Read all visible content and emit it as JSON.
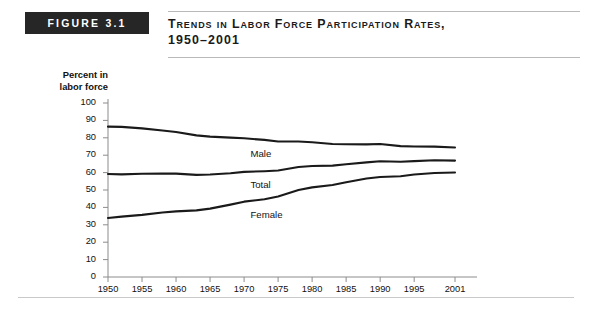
{
  "figure": {
    "badge": "FIGURE 3.1",
    "title_line1": "Trends in Labor Force Participation Rates,",
    "title_line2": "1950–2001"
  },
  "chart_data": {
    "type": "line",
    "xlabel": "",
    "ylabel": "Percent in labor force",
    "ylabel_line1": "Percent in",
    "ylabel_line2": "labor force",
    "ylim": [
      0,
      100
    ],
    "xlim": [
      1950,
      2001
    ],
    "grid": false,
    "legend": "inline-labels",
    "ytick_labels": [
      "100",
      "90",
      "80",
      "70",
      "60",
      "50",
      "40",
      "30",
      "20",
      "10",
      "0"
    ],
    "ytick_values": [
      100,
      90,
      80,
      70,
      60,
      50,
      40,
      30,
      20,
      10,
      0
    ],
    "xtick_labels": [
      "1950",
      "1955",
      "1960",
      "1965",
      "1970",
      "1975",
      "1980",
      "1985",
      "1990",
      "1995",
      "2001"
    ],
    "xtick_values": [
      1950,
      1955,
      1960,
      1965,
      1970,
      1975,
      1980,
      1985,
      1990,
      1995,
      2001
    ],
    "x": [
      1950,
      1952,
      1955,
      1958,
      1960,
      1963,
      1965,
      1968,
      1970,
      1973,
      1975,
      1978,
      1980,
      1983,
      1985,
      1988,
      1990,
      1993,
      1995,
      1998,
      2001
    ],
    "series": [
      {
        "name": "Male",
        "label": "Male",
        "color": "#1a1a1a",
        "values": [
          86.4,
          86.3,
          85.4,
          84.2,
          83.3,
          81.4,
          80.7,
          80.1,
          79.7,
          78.8,
          77.9,
          77.9,
          77.4,
          76.4,
          76.3,
          76.2,
          76.4,
          75.2,
          75.0,
          74.9,
          74.4
        ]
      },
      {
        "name": "Total",
        "label": "Total",
        "color": "#1a1a1a",
        "values": [
          59.2,
          59.0,
          59.3,
          59.5,
          59.4,
          58.7,
          58.9,
          59.6,
          60.4,
          60.8,
          61.2,
          63.2,
          63.8,
          64.0,
          64.8,
          65.9,
          66.5,
          66.2,
          66.6,
          67.1,
          66.9
        ]
      },
      {
        "name": "Female",
        "label": "Female",
        "color": "#1a1a1a",
        "values": [
          33.9,
          34.7,
          35.7,
          37.1,
          37.7,
          38.3,
          39.3,
          41.6,
          43.3,
          44.7,
          46.3,
          50.0,
          51.5,
          52.9,
          54.5,
          56.6,
          57.5,
          57.9,
          58.9,
          59.8,
          60.1
        ]
      }
    ]
  }
}
